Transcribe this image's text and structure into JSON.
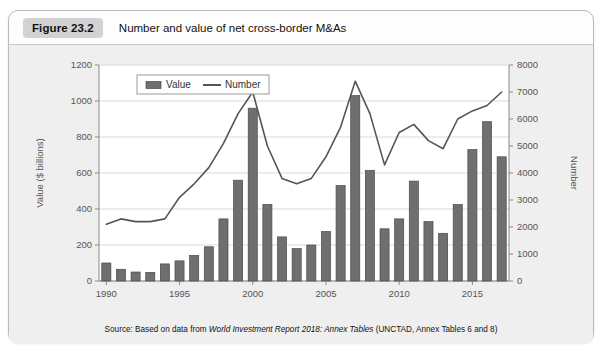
{
  "figure": {
    "badge": "Figure 23.2",
    "title": "Number and value of net cross-border M&As",
    "source_prefix": "Source: Based on data from ",
    "source_italic": "World Investment Report 2018: Annex Tables",
    "source_suffix": " (UNCTAD, Annex Tables 6 and 8)"
  },
  "colors": {
    "bar": "#6f6f6f",
    "bar_edge": "#4a4a4a",
    "line": "#555555",
    "grid": "#d9d9d9",
    "axis": "#8a8a8a",
    "plot_bg": "#ffffff",
    "panel_bg": "#efefef",
    "badge_bg": "#d2d2d2"
  },
  "chart_data": {
    "type": "bar",
    "title": "Number and value of net cross-border M&As",
    "xlabel": "",
    "ylabel": "Value ($ billions)",
    "y2label": "Number",
    "ylim": [
      0,
      1200
    ],
    "y2lim": [
      0,
      8000
    ],
    "yticks": [
      0,
      200,
      400,
      600,
      800,
      1000,
      1200
    ],
    "y2ticks": [
      0,
      1000,
      2000,
      3000,
      4000,
      5000,
      6000,
      7000,
      8000
    ],
    "grid": true,
    "legend_position": "top-left",
    "categories": [
      1990,
      1991,
      1992,
      1993,
      1994,
      1995,
      1996,
      1997,
      1998,
      1999,
      2000,
      2001,
      2002,
      2003,
      2004,
      2005,
      2006,
      2007,
      2008,
      2009,
      2010,
      2011,
      2012,
      2013,
      2014,
      2015,
      2016,
      2017
    ],
    "xtick_labels": [
      "1990",
      "1995",
      "2000",
      "2005",
      "2010",
      "2015"
    ],
    "xtick_values": [
      1990,
      1995,
      2000,
      2005,
      2010,
      2015
    ],
    "series": [
      {
        "name": "Value",
        "axis": "left",
        "unit": "$ billions",
        "type": "bar",
        "values": [
          100,
          65,
          50,
          48,
          95,
          112,
          142,
          190,
          345,
          560,
          960,
          425,
          245,
          180,
          200,
          275,
          530,
          1030,
          615,
          290,
          345,
          555,
          330,
          265,
          425,
          730,
          885,
          690
        ]
      },
      {
        "name": "Number",
        "axis": "right",
        "unit": "count",
        "type": "line",
        "values": [
          2100,
          2300,
          2200,
          2200,
          2300,
          3100,
          3600,
          4200,
          5100,
          6200,
          7000,
          5000,
          3800,
          3600,
          3800,
          4600,
          5700,
          7400,
          6200,
          4300,
          5500,
          5800,
          5200,
          4900,
          6000,
          6300,
          6500,
          7000
        ]
      }
    ]
  }
}
